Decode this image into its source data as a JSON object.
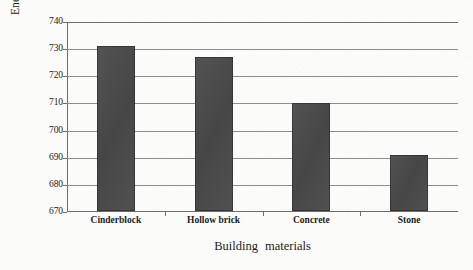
{
  "chart_data": {
    "type": "bar",
    "title": "",
    "subtitle": "",
    "xlabel": "Building  materials",
    "ylabel": "Energy consumption (KWh)",
    "categories": [
      "Cinderblock",
      "Hollow brick",
      "Concrete",
      "Stone"
    ],
    "values": [
      731,
      727,
      710,
      691
    ],
    "ylim": [
      670,
      740
    ],
    "ytick_step": 10,
    "yticks": [
      670,
      680,
      690,
      700,
      710,
      720,
      730,
      740
    ],
    "ytick_labels": [
      "670",
      "680",
      "690",
      "700",
      "710",
      "720",
      "730",
      "740"
    ],
    "grid": true,
    "grid_axis": "y",
    "legend": null,
    "legend_position": "none",
    "series": [
      {
        "name": "Energy consumption",
        "values": [
          731,
          727,
          710,
          691
        ]
      }
    ],
    "colors": {
      "bar_fill": "#4a4a4a",
      "gridline": "#8d8d8d",
      "axis": "#6d6d6d",
      "background": "#fbfbf9",
      "text": "#1c1c1c"
    },
    "annotations": []
  }
}
